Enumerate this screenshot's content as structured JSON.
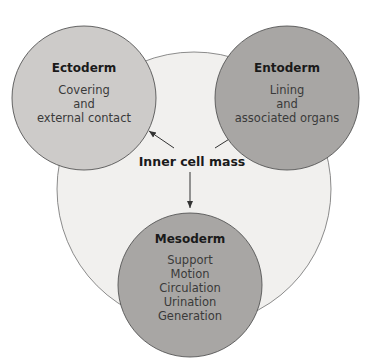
{
  "diagram": {
    "center": {
      "label": "Inner cell mass",
      "color": "#f1f0ee"
    },
    "layers": [
      {
        "name": "Ectoderm",
        "lines": [
          "Covering",
          "and",
          "external contact"
        ],
        "color": "#cdcbc9"
      },
      {
        "name": "Entoderm",
        "lines": [
          "Lining",
          "and",
          "associated organs"
        ],
        "color": "#a8a6a4"
      },
      {
        "name": "Mesoderm",
        "lines": [
          "Support",
          "Motion",
          "Circulation",
          "Urination",
          "Generation"
        ],
        "color": "#a8a6a4"
      }
    ]
  }
}
